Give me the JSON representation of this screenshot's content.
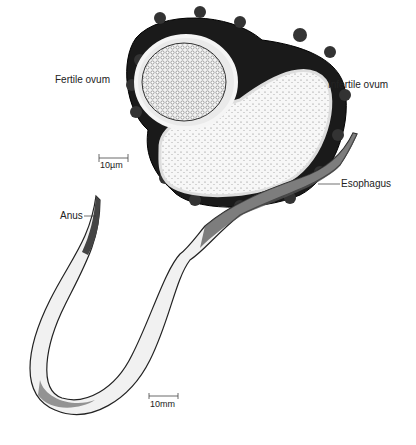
{
  "figure": {
    "labels": {
      "fertile_ovum": "Fertile ovum",
      "infertile_ovum": "Infertile ovum",
      "esophagus": "Esophagus",
      "anus": "Anus"
    },
    "scale_bars": {
      "ovum": "10µm",
      "worm": "10mm"
    }
  }
}
